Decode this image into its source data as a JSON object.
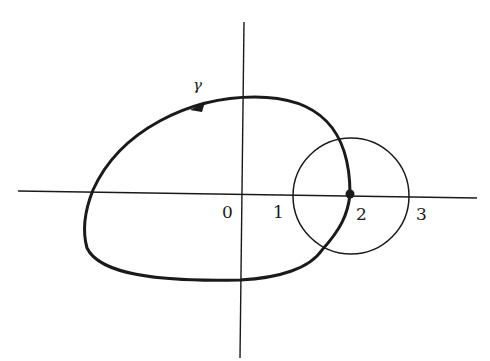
{
  "diagram": {
    "curve_label": "γ",
    "tick_labels": {
      "zero": "0",
      "one": "1",
      "two": "2",
      "three": "3"
    },
    "colors": {
      "ink": "#1a1a1a",
      "background": "#ffffff"
    }
  }
}
